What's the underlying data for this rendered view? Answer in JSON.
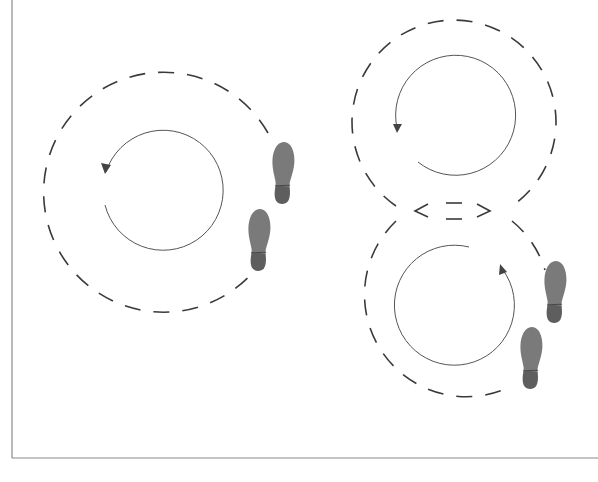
{
  "diagram": {
    "title": "",
    "colors": {
      "frame": "#8a8a8a",
      "dashed_path": "#3a3a3a",
      "guide_circle": "#555555",
      "footprint_sole": "#7a7a7a",
      "footprint_heel": "#5e5e5e",
      "background": "#ffffff"
    },
    "figures": [
      {
        "name": "single-circle-figure",
        "dashed_circle": {
          "cx": 163,
          "cy": 190,
          "r": 120
        },
        "rotation": {
          "cx": 164,
          "cy": 191,
          "r": 60,
          "direction": "counterclockwise"
        },
        "footprints": [
          {
            "side": "right-foot",
            "x": 283,
            "y": 173
          },
          {
            "side": "left-foot",
            "x": 259,
            "y": 240
          }
        ]
      },
      {
        "name": "figure-eight-figure",
        "dashed_circles": [
          {
            "cx": 454,
            "cy": 122,
            "r": 102
          },
          {
            "cx": 454,
            "cy": 305,
            "r": 102
          }
        ],
        "rotations": [
          {
            "cx": 456,
            "cy": 115,
            "r": 60,
            "direction": "counterclockwise"
          },
          {
            "cx": 456,
            "cy": 307,
            "r": 60,
            "direction": "counterclockwise"
          }
        ],
        "footprints": [
          {
            "side": "right-foot",
            "x": 555,
            "y": 292
          },
          {
            "side": "left-foot",
            "x": 531,
            "y": 358
          }
        ]
      }
    ],
    "icons": {
      "footprint": "shoe-sole-icon",
      "arrow": "arrowhead-icon"
    }
  }
}
